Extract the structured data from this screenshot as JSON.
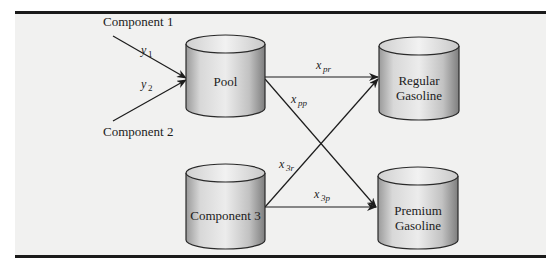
{
  "diagram": {
    "sources": [
      {
        "id": "component1",
        "label": "Component 1"
      },
      {
        "id": "component2",
        "label": "Component 2"
      }
    ],
    "tanks": [
      {
        "id": "pool",
        "label": "Pool"
      },
      {
        "id": "component3",
        "label": "Component 3"
      },
      {
        "id": "regular",
        "label_line1": "Regular",
        "label_line2": "Gasoline"
      },
      {
        "id": "premium",
        "label_line1": "Premium",
        "label_line2": "Gasoline"
      }
    ],
    "flows": [
      {
        "from": "component1",
        "to": "pool",
        "var": "y",
        "sub": "1"
      },
      {
        "from": "component2",
        "to": "pool",
        "var": "y",
        "sub": "2"
      },
      {
        "from": "pool",
        "to": "regular",
        "var": "x",
        "sub": "pr"
      },
      {
        "from": "pool",
        "to": "premium",
        "var": "x",
        "sub": "pp"
      },
      {
        "from": "component3",
        "to": "regular",
        "var": "x",
        "sub": "3r"
      },
      {
        "from": "component3",
        "to": "premium",
        "var": "x",
        "sub": "3p"
      }
    ]
  },
  "colors": {
    "panel": "#f1f1f0",
    "rule": "#1a1a1a",
    "tank_stroke": "#2a2a2a",
    "tank_light": "#e6e6e6",
    "tank_dark": "#8c8c8c"
  }
}
